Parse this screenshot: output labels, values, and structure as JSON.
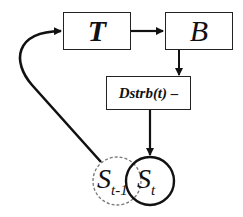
{
  "diagram": {
    "nodes": {
      "T": {
        "label": "T"
      },
      "B": {
        "label": "B"
      },
      "Dstrb": {
        "label": "Dstrb(t) –"
      },
      "S_t": {
        "label_main": "S",
        "label_sub": "t"
      },
      "S_t_minus_1": {
        "label_main": "S",
        "label_sub": "t-1",
        "style": "dashed"
      }
    },
    "edges": [
      {
        "from": "T",
        "to": "B"
      },
      {
        "from": "B",
        "to": "Dstrb"
      },
      {
        "from": "Dstrb",
        "to": "S_t"
      },
      {
        "from": "S_t_minus_1",
        "to": "T",
        "style": "curved"
      }
    ],
    "colors": {
      "stroke": "#111111",
      "dashed": "#777777",
      "background": "#ffffff"
    }
  }
}
